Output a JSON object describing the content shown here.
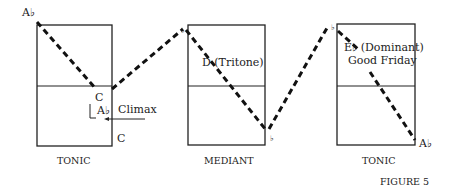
{
  "figure": {
    "caption": "FIGURE 5",
    "panels": [
      {
        "label": "TONIC",
        "top_note": "A♭",
        "mid_note": "C",
        "inner_note": "A♭",
        "bottom_note": "C",
        "annotation": "Climax"
      },
      {
        "label": "MEDIANT",
        "top_note": "♭",
        "text": "D (Tritone)",
        "bottom_note": "♭"
      },
      {
        "label": "TONIC",
        "top_note": "♭",
        "text_line1": "E♭ (Dominant)",
        "text_line2": "Good Friday",
        "bottom_note": "A♭"
      }
    ]
  }
}
